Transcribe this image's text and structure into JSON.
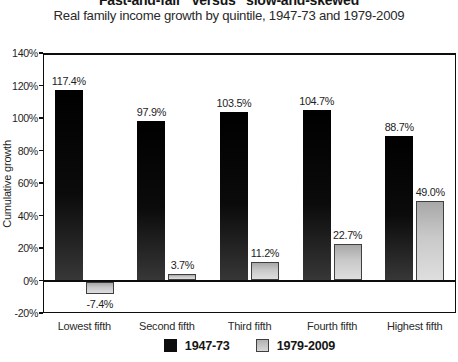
{
  "title": "“Fast-and-fair” versus “slow-and-skewed”",
  "subtitle": "Real family income growth by quintile, 1947-73 and 1979-2009",
  "chart_data": {
    "type": "bar",
    "categories": [
      "Lowest fifth",
      "Second fifth",
      "Third fifth",
      "Fourth fifth",
      "Highest fifth"
    ],
    "series": [
      {
        "name": "1947-73",
        "color": "#0d0d0d",
        "values": [
          117.4,
          97.9,
          103.5,
          104.7,
          88.7
        ]
      },
      {
        "name": "1979-2009",
        "color": "#c9c9c9",
        "values": [
          -7.4,
          3.7,
          11.2,
          22.7,
          49.0
        ]
      }
    ],
    "value_labels": {
      "1947-73": [
        "117.4%",
        "97.9%",
        "103.5%",
        "104.7%",
        "88.7%"
      ],
      "1979-2009": [
        "-7.4%",
        "3.7%",
        "11.2%",
        "22.7%",
        "49.0%"
      ]
    },
    "xlabel": "",
    "ylabel": "Cumulative growth",
    "ylim": [
      -20,
      140
    ],
    "ytick_step": 20,
    "yticks": [
      "140%",
      "120%",
      "100%",
      "80%",
      "60%",
      "40%",
      "20%",
      "0%",
      "-20%"
    ],
    "grid": false,
    "legend_position": "bottom-center"
  }
}
